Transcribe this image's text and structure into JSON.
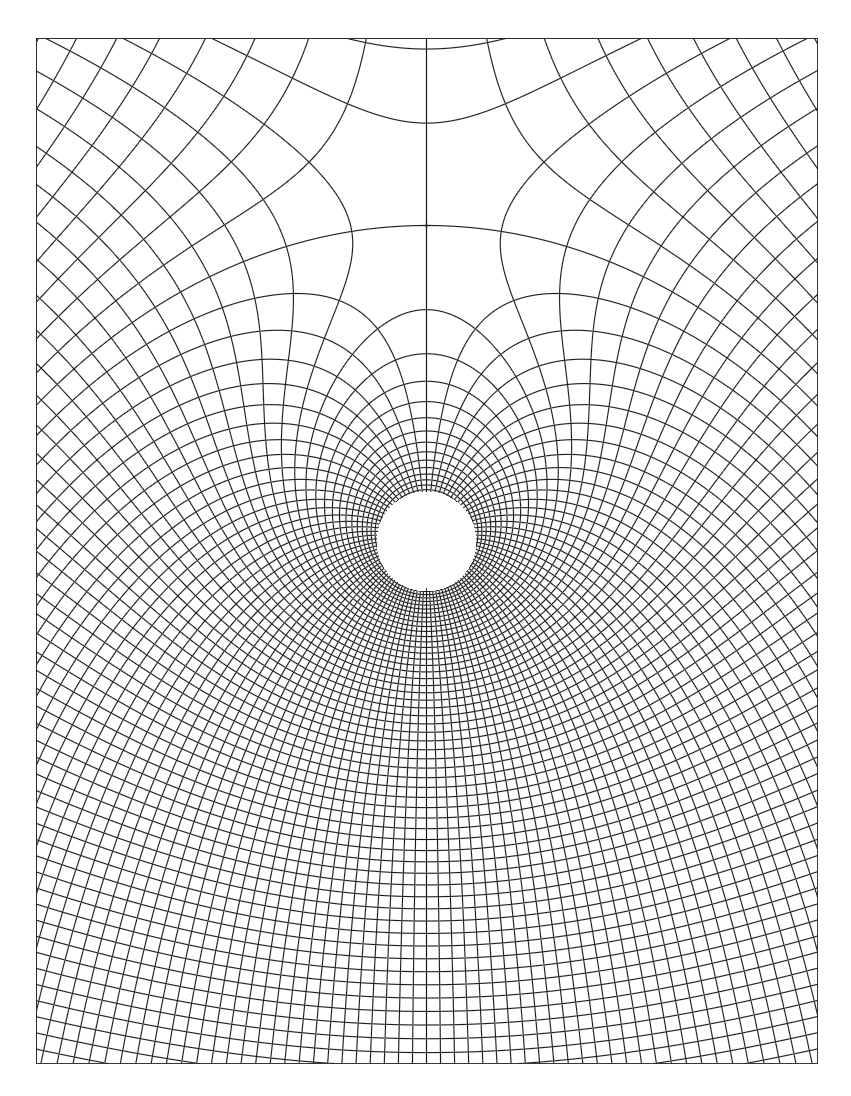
{
  "figure": {
    "type": "conformal-mesh",
    "canvas": {
      "width": 851,
      "height": 1096,
      "background": "#ffffff"
    },
    "frame": {
      "x0": 36,
      "y0": 38,
      "x1": 817,
      "y1": 1063,
      "stroke": "#222222"
    },
    "hole": {
      "cx": 426,
      "cy": 541,
      "r": 50
    },
    "saddle_distance": 316,
    "radial_line_count": 88,
    "line_color": "#1e1e1e",
    "line_width": 0.6,
    "center_axis": {
      "top_y": 38,
      "bottom_segment": [
        588,
        596
      ]
    }
  }
}
